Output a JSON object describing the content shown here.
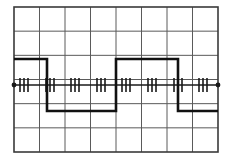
{
  "display": {
    "title": "Oscilloscope square wave display",
    "background_color": "#ffffff",
    "grid_color": "#5a5a5a",
    "grid_border_color": "#3a3a3a",
    "axis_color": "#1a1a1a",
    "trace_color": "#111111",
    "tick_color": "#1a1a1a",
    "graticule": {
      "left": 14,
      "top": 7,
      "right": 218,
      "bottom": 152,
      "columns": 8,
      "rows": 6,
      "col_step": 25.5,
      "row_step": 24.1667
    },
    "center_axis_y": 85,
    "axis_start_x": 14,
    "axis_end_x": 218
  },
  "chart_data": {
    "type": "line",
    "xlabel": "",
    "ylabel": "",
    "grid": true,
    "legend": null,
    "x_divisions": 8,
    "y_divisions": 6,
    "xlim": [
      0,
      8
    ],
    "ylim": [
      -3,
      3
    ],
    "series": [
      {
        "name": "square-wave-trace",
        "color": "#111111",
        "line_width": 2.6,
        "units": "divisions",
        "high_level_div": 1.05,
        "low_level_div": -1.05,
        "points_px": [
          [
            14,
            59
          ],
          [
            47,
            59
          ],
          [
            47,
            111
          ],
          [
            116,
            111
          ],
          [
            116,
            59
          ],
          [
            178,
            59
          ],
          [
            178,
            111
          ],
          [
            218,
            111
          ]
        ],
        "edges_px": [
          {
            "type": "fall",
            "x": 47
          },
          {
            "type": "rise",
            "x": 116
          },
          {
            "type": "fall",
            "x": 178
          }
        ],
        "high_level_px_y": 59,
        "low_level_px_y": 111
      },
      {
        "name": "center-axis-line",
        "color": "#1a1a1a",
        "line_width": 1.4,
        "y_px": 85,
        "from_x_px": 14,
        "to_x_px": 218
      }
    ],
    "minor_tick_marks": {
      "description": "Groups of short vertical minor-division tick marks along the centre horizontal axis",
      "axis_y_px": 85,
      "tick_half_height_px": 7,
      "tick_width_px": 1.6,
      "end_dot_radius_px": 2.4,
      "x_positions_px": [
        20,
        24,
        28,
        46,
        50,
        54,
        71,
        75,
        79,
        97,
        101,
        105,
        122,
        126,
        130,
        148,
        152,
        156,
        174,
        178,
        182,
        199,
        203,
        207
      ]
    }
  },
  "annotations": {
    "waveform_name": "square-wave",
    "duty_cycle_label": "",
    "period_divisions": 5.1
  }
}
